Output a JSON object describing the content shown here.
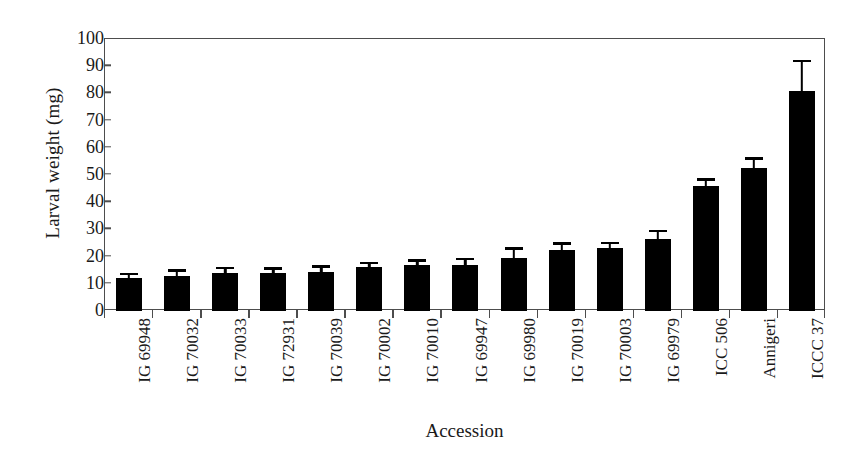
{
  "chart_data": {
    "type": "bar",
    "title": "",
    "xlabel": "Accession",
    "ylabel": "Larval weight (mg)",
    "ylim": [
      0,
      100
    ],
    "yticks": [
      0,
      10,
      20,
      30,
      40,
      50,
      60,
      70,
      80,
      90,
      100
    ],
    "grid": false,
    "legend": "none",
    "bar_color": "#000000",
    "axis_color": "#4d4d4d",
    "categories": [
      "IG 69948",
      "IG 70032",
      "IG 70033",
      "IG 72931",
      "IG 70039",
      "IG 70002",
      "IG 70010",
      "IG 69947",
      "IG 69980",
      "IG 70019",
      "IG 70003",
      "IG 69979",
      "ICC 506",
      "Annigeri",
      "ICCC 37"
    ],
    "values": [
      12,
      13,
      14,
      14,
      14.5,
      16,
      17,
      16.8,
      19.5,
      22.5,
      23,
      26.5,
      46,
      52.5,
      81
    ],
    "errors": [
      1.2,
      1.5,
      1.3,
      1.2,
      1.3,
      1.2,
      1.2,
      1.8,
      3.0,
      1.8,
      1.5,
      2.5,
      1.8,
      3.0,
      10.5
    ],
    "error_type": "standard error"
  }
}
